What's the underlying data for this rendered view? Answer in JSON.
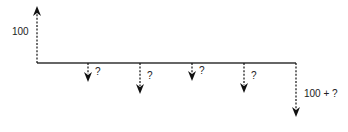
{
  "diagram": {
    "type": "cash-flow",
    "timeline": {
      "x1": 37,
      "x2": 296,
      "y": 63,
      "color": "#333333"
    },
    "inflow": {
      "x": 37,
      "label": "100",
      "label_x": 12,
      "label_y": 27,
      "top_y": 6
    },
    "outflows": [
      {
        "x": 88,
        "end_y": 82,
        "label": "?",
        "label_x": 95,
        "label_y": 67
      },
      {
        "x": 140,
        "end_y": 94,
        "label": "?",
        "label_x": 147,
        "label_y": 71
      },
      {
        "x": 192,
        "end_y": 81,
        "label": "?",
        "label_x": 199,
        "label_y": 66
      },
      {
        "x": 244,
        "end_y": 93,
        "label": "?",
        "label_x": 251,
        "label_y": 71
      },
      {
        "x": 296,
        "end_y": 117,
        "label": "100 + ?",
        "label_x": 304,
        "label_y": 89
      }
    ],
    "arrow_color": "#111111"
  }
}
